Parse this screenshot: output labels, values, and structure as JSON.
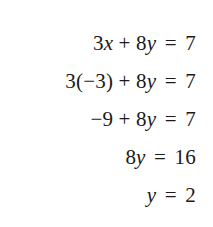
{
  "document": {
    "type": "math-worksheet-solution-steps",
    "background_color": "#ffffff",
    "text_color": "#1a1a1a",
    "alignment": "right",
    "equations": [
      {
        "id": "step-1",
        "text": "3x + 8y = 7",
        "lhs": "3x + 8y",
        "rhs": "7"
      },
      {
        "id": "step-2",
        "text": "3(−3) + 8y = 7",
        "lhs": "3(−3) + 8y",
        "rhs": "7"
      },
      {
        "id": "step-3",
        "text": "−9 + 8y = 7",
        "lhs": "−9 + 8y",
        "rhs": "7"
      },
      {
        "id": "step-4",
        "text": "8y = 16",
        "lhs": "8y",
        "rhs": "16"
      },
      {
        "id": "step-5",
        "text": "y = 2",
        "lhs": "y",
        "rhs": "2"
      }
    ]
  }
}
